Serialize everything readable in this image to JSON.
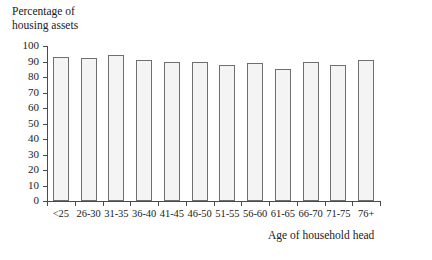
{
  "chart_data": {
    "type": "bar",
    "title": "",
    "ylabel": "Percentage of housing assets",
    "ylabel_lines": [
      "Percentage of",
      "housing assets"
    ],
    "xlabel": "Age of household head",
    "categories": [
      "<25",
      "26-30",
      "31-35",
      "36-40",
      "41-45",
      "46-50",
      "51-55",
      "56-60",
      "61-65",
      "66-70",
      "71-75",
      "76+"
    ],
    "values": [
      93,
      92,
      94,
      91,
      90,
      90,
      88,
      89,
      85,
      90,
      88,
      91
    ],
    "ylim": [
      0,
      100
    ],
    "yticks": [
      0,
      10,
      20,
      30,
      40,
      50,
      60,
      70,
      80,
      90,
      100
    ],
    "ytick_labels": [
      "0",
      "10",
      "20",
      "30",
      "40",
      "50",
      "60",
      "70",
      "80",
      "90",
      "100"
    ],
    "grid": false,
    "legend": null,
    "bar_fill_color": "#f4f4f4",
    "bar_edge_color": "#6f6f6f",
    "axis_color": "#4a4a4a"
  }
}
